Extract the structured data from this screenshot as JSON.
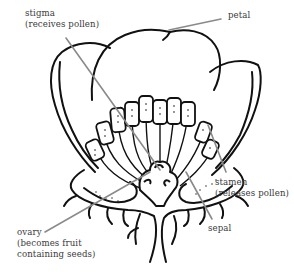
{
  "diagram": {
    "line_color": "#111111",
    "leader_color": "#8a8a8a",
    "labels": {
      "stigma": {
        "title": "stigma",
        "note": "(receives pollen)"
      },
      "petal": {
        "title": "petal"
      },
      "stamen": {
        "title": "stamen",
        "note": "(releases pollen)"
      },
      "sepal": {
        "title": "sepal"
      },
      "ovary": {
        "title": "ovary",
        "note1": "(becomes fruit",
        "note2": "containing seeds)"
      }
    }
  }
}
